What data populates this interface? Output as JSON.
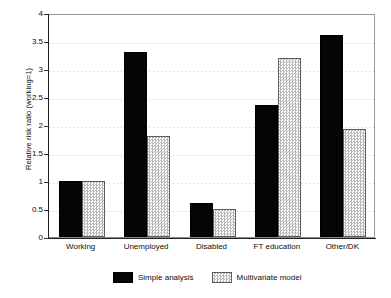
{
  "chart_data": {
    "type": "bar",
    "title": "",
    "xlabel": "",
    "ylabel": "Relative risk ratio (working=1)",
    "categories": [
      "Working",
      "Unemployed",
      "Disabled",
      "FT education",
      "Other/DK"
    ],
    "series": [
      {
        "name": "Simple analysis",
        "values": [
          1.0,
          3.3,
          0.6,
          2.35,
          3.6
        ]
      },
      {
        "name": "Multivariate model",
        "values": [
          1.0,
          1.8,
          0.5,
          3.2,
          1.93
        ]
      }
    ],
    "ylim": [
      0,
      4
    ],
    "yticks": [
      0,
      0.5,
      1,
      1.5,
      2,
      2.5,
      3,
      3.5,
      4
    ],
    "ytick_labels": [
      "0",
      "0.5",
      "1",
      "1.5",
      "2",
      "2.5",
      "3",
      "3.5",
      "4"
    ],
    "grid": "horizontal-dotted",
    "legend_position": "bottom-center",
    "colors": {
      "series_0": "#050505",
      "series_1": "#d2d2d2",
      "gridline": "#c9c9c9",
      "axis": "#222222",
      "background": "#ffffff"
    }
  }
}
